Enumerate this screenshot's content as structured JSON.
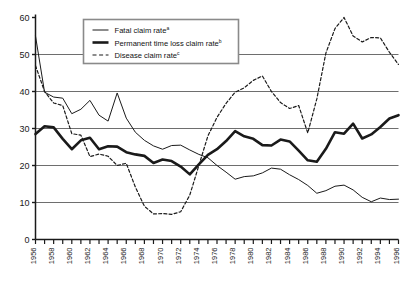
{
  "chart_data": {
    "type": "line",
    "title": "",
    "xlabel": "",
    "ylabel": "",
    "xlim": [
      1956,
      1996
    ],
    "ylim": [
      0,
      60
    ],
    "grid": "horizontal",
    "legend_position": "top-center-left",
    "y_ticks": [
      "0",
      "10",
      "20",
      "30",
      "40",
      "50",
      "60"
    ],
    "y_tick_values": [
      0,
      10,
      20,
      30,
      40,
      50,
      60
    ],
    "x_tick_labels": [
      "1956",
      "1958",
      "1960",
      "1962",
      "1964",
      "1966",
      "1968",
      "1970",
      "1972",
      "1974",
      "1976",
      "1978",
      "1980",
      "1982",
      "1984",
      "1986",
      "1988",
      "1990",
      "1992",
      "1994",
      "1996"
    ],
    "x_all_years": [
      1956,
      1957,
      1958,
      1959,
      1960,
      1961,
      1962,
      1963,
      1964,
      1965,
      1966,
      1967,
      1968,
      1969,
      1970,
      1971,
      1972,
      1973,
      1974,
      1975,
      1976,
      1977,
      1978,
      1979,
      1980,
      1981,
      1982,
      1983,
      1984,
      1985,
      1986,
      1987,
      1988,
      1989,
      1990,
      1991,
      1992,
      1993,
      1994,
      1995,
      1996
    ],
    "series": [
      {
        "name": "Fatal claim rate",
        "superscript": "a",
        "style": "thin-solid",
        "color": "#1a1a1a",
        "values": [
          55.0,
          39.8,
          38.5,
          38.2,
          34.0,
          35.2,
          37.6,
          33.6,
          32.0,
          39.6,
          32.8,
          29.0,
          26.8,
          25.3,
          24.4,
          25.4,
          25.5,
          24.2,
          23.0,
          22.1,
          20.0,
          18.2,
          16.3,
          17.0,
          17.2,
          18.0,
          19.3,
          19.0,
          17.5,
          16.2,
          14.6,
          12.5,
          13.2,
          14.4,
          14.7,
          13.4,
          11.4,
          10.2,
          11.2,
          10.8,
          10.9
        ]
      },
      {
        "name": "Permanent time loss claim rate",
        "superscript": "b",
        "style": "thick-solid",
        "color": "#1a1a1a",
        "values": [
          28.5,
          30.6,
          30.3,
          27.2,
          24.4,
          26.8,
          27.5,
          24.4,
          25.2,
          25.1,
          23.6,
          23.0,
          22.6,
          20.7,
          21.6,
          21.2,
          19.7,
          17.6,
          20.3,
          22.9,
          24.4,
          26.6,
          29.3,
          27.9,
          27.2,
          25.5,
          25.4,
          27.0,
          26.5,
          24.0,
          21.4,
          21.0,
          24.5,
          29.0,
          28.6,
          31.3,
          27.3,
          28.4,
          30.4,
          32.7,
          33.6
        ]
      },
      {
        "name": "Disease claim rate",
        "superscript": "c",
        "style": "dashed",
        "color": "#1a1a1a",
        "values": [
          47.0,
          40.0,
          36.9,
          36.2,
          28.6,
          28.2,
          22.4,
          23.1,
          22.5,
          20.0,
          20.6,
          14.2,
          9.0,
          6.9,
          7.0,
          6.8,
          7.5,
          12.0,
          20.0,
          28.0,
          33.0,
          36.8,
          39.8,
          41.0,
          43.0,
          44.2,
          40.0,
          37.0,
          35.4,
          36.2,
          28.8,
          38.0,
          50.4,
          57.0,
          60.0,
          55.0,
          53.4,
          54.6,
          54.5,
          50.6,
          47.3
        ]
      }
    ],
    "legend_entries": [
      {
        "label": "Fatal claim rate",
        "superscript": "a",
        "style": "thin-solid"
      },
      {
        "label": "Permanent time loss claim rate",
        "superscript": "b",
        "style": "thick-solid"
      },
      {
        "label": "Disease claim rate",
        "superscript": "c",
        "style": "dashed"
      }
    ]
  }
}
